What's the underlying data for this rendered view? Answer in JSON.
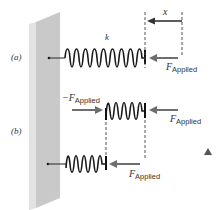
{
  "figure": {
    "panels": [
      {
        "id": "a",
        "label": "(a)",
        "spring_constant_label": "k",
        "displacement_label": "x",
        "forces": [
          {
            "symbol": "F",
            "subscript": "Applied",
            "direction": "left"
          }
        ]
      },
      {
        "id": "b",
        "label": "(b)",
        "forces": [
          {
            "symbol": "−F",
            "subscript": "Applied",
            "direction": "right"
          },
          {
            "symbol": "F",
            "subscript": "Applied",
            "direction": "left"
          },
          {
            "symbol": "F",
            "subscript": "Applied",
            "direction": "left"
          }
        ]
      }
    ],
    "colors": {
      "wall_front": "#c9c9c9",
      "wall_side": "#e2e2e2",
      "spring": "#1a1a1a",
      "arrow": "#6e6e6e",
      "dashed": "#444444",
      "marker": "#555555"
    }
  }
}
